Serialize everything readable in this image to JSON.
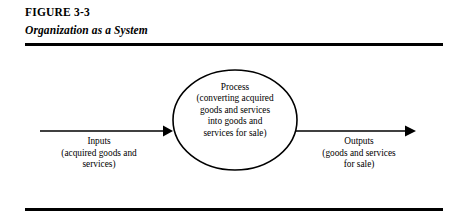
{
  "figure": {
    "number": "FIGURE 3-3",
    "title": "Organization as a System"
  },
  "diagram": {
    "process": {
      "lines": [
        "Process",
        "(converting acquired",
        "goods and services",
        "into goods and",
        "services for sale)"
      ]
    },
    "inputs": {
      "lines": [
        "Inputs",
        "(acquired goods and",
        "services)"
      ]
    },
    "outputs": {
      "lines": [
        "Outputs",
        "(goods and services",
        "for sale)"
      ]
    },
    "colors": {
      "ink": "#000000",
      "background": "#ffffff"
    }
  }
}
